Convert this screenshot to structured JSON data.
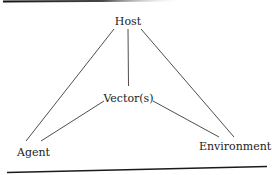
{
  "diagram": {
    "type": "triangle-relationship",
    "nodes": [
      {
        "id": "host",
        "label": "Host"
      },
      {
        "id": "vectors",
        "label": "Vector(s)"
      },
      {
        "id": "agent",
        "label": "Agent"
      },
      {
        "id": "environment",
        "label": "Environment"
      }
    ],
    "edges": [
      {
        "from": "host",
        "to": "agent"
      },
      {
        "from": "host",
        "to": "vectors"
      },
      {
        "from": "host",
        "to": "environment"
      },
      {
        "from": "vectors",
        "to": "agent"
      },
      {
        "from": "vectors",
        "to": "environment"
      }
    ]
  },
  "colors": {
    "text": "#222222",
    "lines": "#3a3a3a",
    "rule": "#1a1a1a",
    "background": "#ffffff"
  }
}
